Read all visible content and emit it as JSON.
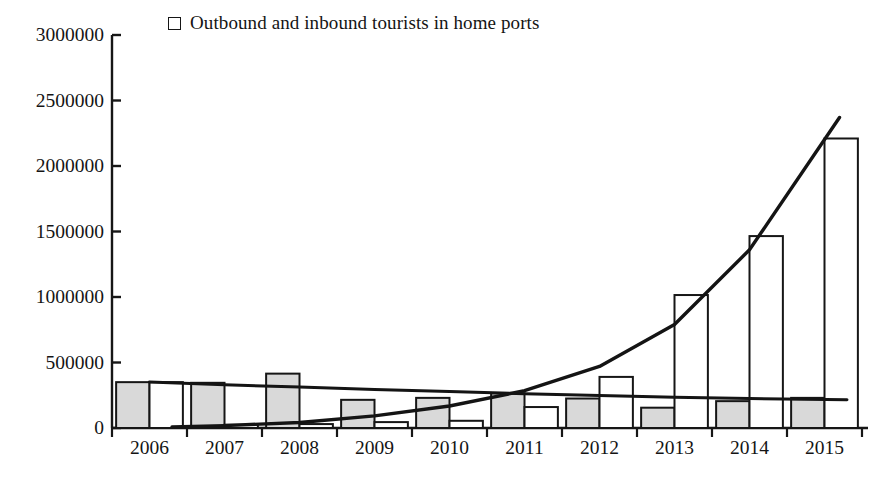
{
  "legend": {
    "label": "Outbound and inbound tourists in home ports",
    "swatch_name": "open-square-marker",
    "swatch_fill": "#ffffff",
    "swatch_stroke": "#161616"
  },
  "colors": {
    "axis": "#161616",
    "bar_gray_fill": "#d9d9d9",
    "bar_white_fill": "#ffffff",
    "bar_stroke": "#161616",
    "trend_line": "#141414",
    "background": "#ffffff"
  },
  "chart_data": {
    "type": "bar",
    "title": "",
    "subtitle": "",
    "xlabel": "",
    "ylabel": "",
    "xlim": [
      2005.5,
      2015.5
    ],
    "ylim": [
      0,
      3000000
    ],
    "grid": false,
    "legend_position": "top-left",
    "categories": [
      "2006",
      "2007",
      "2008",
      "2009",
      "2010",
      "2011",
      "2012",
      "2013",
      "2014",
      "2015"
    ],
    "ytick_values": [
      0,
      500000,
      1000000,
      1500000,
      2000000,
      2500000,
      3000000
    ],
    "ytick_labels": [
      "0",
      "500000",
      "1000000",
      "1500000",
      "2000000",
      "2500000",
      "3000000"
    ],
    "series": [
      {
        "name": "Outbound and inbound tourists in home ports",
        "style": "bar-gray",
        "fill": "#d9d9d9",
        "values": [
          350000,
          345000,
          415000,
          215000,
          230000,
          265000,
          225000,
          155000,
          205000,
          230000
        ]
      },
      {
        "name": "Home port cruise passengers",
        "style": "bar-white",
        "fill": "#ffffff",
        "values": [
          350000,
          25000,
          30000,
          45000,
          55000,
          160000,
          390000,
          1015000,
          1465000,
          2210000
        ]
      }
    ],
    "trend_lines": [
      {
        "name": "linear-trend",
        "shape": "near-linear",
        "points": [
          {
            "x": 2006.0,
            "y": 352000
          },
          {
            "x": 2007.0,
            "y": 330000
          },
          {
            "x": 2008.0,
            "y": 312000
          },
          {
            "x": 2009.0,
            "y": 295000
          },
          {
            "x": 2010.0,
            "y": 278000
          },
          {
            "x": 2011.0,
            "y": 262000
          },
          {
            "x": 2012.0,
            "y": 248000
          },
          {
            "x": 2013.0,
            "y": 235000
          },
          {
            "x": 2014.0,
            "y": 225000
          },
          {
            "x": 2015.3,
            "y": 215000
          }
        ]
      },
      {
        "name": "exponential-trend",
        "shape": "exponential",
        "points": [
          {
            "x": 2006.3,
            "y": 8000
          },
          {
            "x": 2007.0,
            "y": 18000
          },
          {
            "x": 2008.0,
            "y": 42000
          },
          {
            "x": 2009.0,
            "y": 92000
          },
          {
            "x": 2010.0,
            "y": 168000
          },
          {
            "x": 2011.0,
            "y": 285000
          },
          {
            "x": 2012.0,
            "y": 470000
          },
          {
            "x": 2013.0,
            "y": 790000
          },
          {
            "x": 2014.0,
            "y": 1360000
          },
          {
            "x": 2015.2,
            "y": 2370000
          }
        ]
      }
    ]
  }
}
